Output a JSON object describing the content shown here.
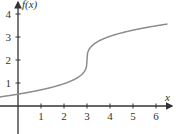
{
  "chart_data": {
    "type": "line",
    "title": "",
    "xlabel": "x",
    "ylabel": "f(x)",
    "xlim": [
      -0.8,
      6.5
    ],
    "ylim": [
      -1.2,
      4.6
    ],
    "x_ticks": [
      1,
      2,
      3,
      4,
      5,
      6
    ],
    "y_ticks": [
      1,
      2,
      3,
      4
    ],
    "grid": false,
    "legend": null,
    "series": [
      {
        "name": "f(x)",
        "description": "cube-root shaped curve with vertical tangent at (3, 2), approx f(x) = 2 + cbrt(x - 3)",
        "x": [
          -0.8,
          0,
          0.5,
          1,
          1.5,
          2,
          2.5,
          2.8,
          2.95,
          3,
          3.05,
          3.2,
          3.5,
          4,
          4.5,
          5,
          5.5,
          6,
          6.5
        ],
        "y": [
          0.44,
          0.56,
          0.64,
          0.74,
          0.85,
          1.0,
          1.21,
          1.42,
          1.63,
          2.0,
          2.37,
          2.58,
          2.79,
          3.0,
          3.14,
          3.26,
          3.36,
          3.44,
          3.52
        ]
      }
    ],
    "line_color": "#8c8c8c",
    "axis_color": "#333333"
  }
}
